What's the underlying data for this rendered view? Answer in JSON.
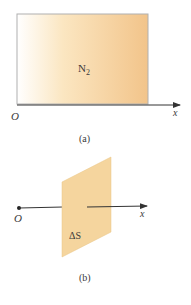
{
  "figure_a": {
    "gas_label": "N",
    "gas_subscript": "2",
    "origin_label": "O",
    "axis_label": "x",
    "caption": "(a)",
    "gradient_start_color": "#ffffff",
    "gradient_end_color": "#f2c48a",
    "border_color": "#b0b0b0"
  },
  "figure_b": {
    "surface_label": "ΔS",
    "origin_label": "O",
    "axis_label": "x",
    "caption": "(b)",
    "surface_color": "#f5d59e"
  },
  "colors": {
    "axis": "#333333"
  }
}
